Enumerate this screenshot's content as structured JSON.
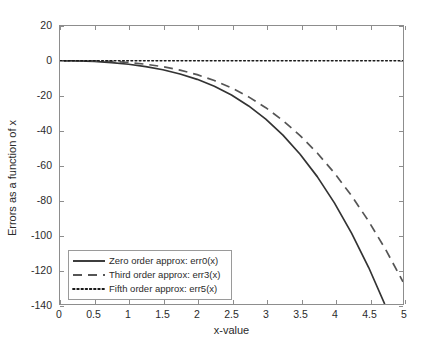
{
  "chart_data": {
    "type": "line",
    "title": "",
    "xlabel": "x-value",
    "ylabel": "Errors as a function of x",
    "xlim": [
      0,
      5
    ],
    "ylim": [
      -140,
      20
    ],
    "xticks": [
      "0",
      "0.5",
      "1",
      "1.5",
      "2",
      "2.5",
      "3",
      "3.5",
      "4",
      "4.5",
      "5"
    ],
    "xtick_values": [
      0,
      0.5,
      1,
      1.5,
      2,
      2.5,
      3,
      3.5,
      4,
      4.5,
      5
    ],
    "yticks": [
      "20",
      "0",
      "-20",
      "-40",
      "-60",
      "-80",
      "-100",
      "-120",
      "-140"
    ],
    "ytick_values": [
      20,
      0,
      -20,
      -40,
      -60,
      -80,
      -100,
      -120,
      -140
    ],
    "grid": false,
    "legend_position": "lower left",
    "series": [
      {
        "name": "Zero order approx: err0(x)",
        "style": "solid",
        "color": "#333333",
        "x": [
          0,
          0.25,
          0.5,
          0.75,
          1,
          1.25,
          1.5,
          1.75,
          2,
          2.25,
          2.5,
          2.75,
          3,
          3.25,
          3.5,
          3.75,
          4,
          4.25,
          4.5,
          4.75,
          5
        ],
        "y": [
          0,
          -0.1,
          -0.4,
          -1.1,
          -2.0,
          -3.4,
          -5.2,
          -7.6,
          -10.7,
          -14.7,
          -19.7,
          -26.0,
          -33.6,
          -42.8,
          -53.8,
          -66.7,
          -81.8,
          -99.2,
          -119.0,
          -141.5,
          -167.0
        ]
      },
      {
        "name": "Third order approx: err3(x)",
        "style": "dashed",
        "color": "#555555",
        "x": [
          0,
          0.25,
          0.5,
          0.75,
          1,
          1.25,
          1.5,
          1.75,
          2,
          2.25,
          2.5,
          2.75,
          3,
          3.25,
          3.5,
          3.75,
          4,
          4.25,
          4.5,
          4.75,
          5
        ],
        "y": [
          0,
          0.0,
          -0.1,
          -0.4,
          -1.0,
          -2.0,
          -3.4,
          -5.4,
          -8.0,
          -11.4,
          -15.6,
          -20.8,
          -27.0,
          -34.4,
          -43.1,
          -53.1,
          -64.6,
          -77.7,
          -92.4,
          -108.9,
          -127.2
        ]
      },
      {
        "name": "Fifth order approx: err5(x)",
        "style": "dotted",
        "color": "#1a1a1a",
        "x": [
          0,
          0.5,
          1,
          1.5,
          2,
          2.5,
          3,
          3.5,
          4,
          4.5,
          5
        ],
        "y": [
          0,
          0,
          0,
          0,
          0,
          0,
          0,
          0,
          0,
          0,
          0
        ]
      }
    ]
  },
  "legend": {
    "items": [
      {
        "label": "Zero order approx: err0(x)",
        "style": "solid"
      },
      {
        "label": "Third order approx: err3(x)",
        "style": "dashed"
      },
      {
        "label": "Fifth order approx: err5(x)",
        "style": "dotted"
      }
    ]
  }
}
